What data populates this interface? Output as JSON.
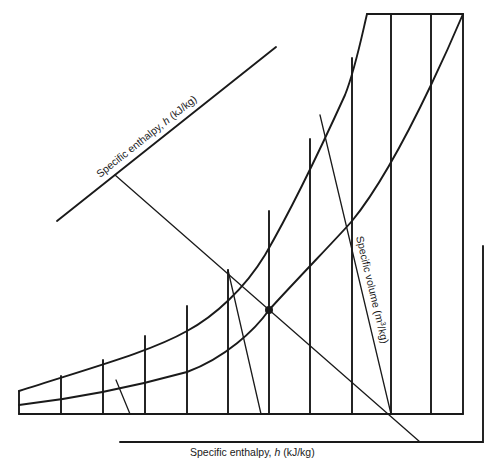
{
  "diagram": {
    "type": "psychrometric-chart-schematic",
    "labels": {
      "enthalpy_diagonal": {
        "prefix": "Specific enthalpy, ",
        "symbol": "h",
        "suffix": " (kJ/kg)"
      },
      "enthalpy_bottom": {
        "prefix": "Specific enthalpy, ",
        "symbol": "h",
        "suffix": " (kJ/kg)"
      },
      "specific_volume": {
        "prefix": "Specific volume (m",
        "sup": "3",
        "suffix": "/kg)"
      }
    },
    "state_point": {
      "x": 269,
      "y": 310
    },
    "colors": {
      "ink": "#1a1a1a",
      "background": "#ffffff"
    }
  }
}
